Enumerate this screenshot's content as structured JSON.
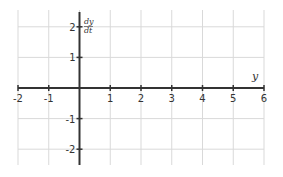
{
  "chart_data": {
    "type": "line",
    "title": "",
    "xlabel": "y",
    "ylabel": "dy/dt",
    "ylabel_numerator": "dy",
    "ylabel_denominator": "dt",
    "xlim": [
      -2,
      6
    ],
    "ylim": [
      -2.5,
      2.5
    ],
    "grid": true,
    "x_ticks": [
      -2,
      -1,
      1,
      2,
      3,
      4,
      5,
      6
    ],
    "x_tick_labels": [
      "-2",
      "-1",
      "1",
      "2",
      "3",
      "4",
      "5",
      "6"
    ],
    "y_ticks": [
      -2,
      -1,
      1,
      2
    ],
    "y_tick_labels": [
      "-2",
      "-1",
      "1",
      "2"
    ],
    "series": []
  },
  "colors": {
    "axis": "#333333",
    "grid": "#d9d9d9",
    "text": "#333333"
  }
}
